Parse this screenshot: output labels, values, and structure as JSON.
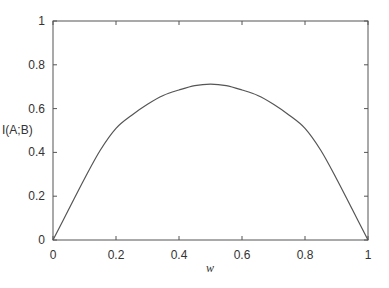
{
  "chart_data": {
    "type": "line",
    "title": "",
    "xlabel": "w",
    "ylabel": "I(A;B)",
    "xlim": [
      0,
      1
    ],
    "ylim": [
      0,
      1
    ],
    "xticks": [
      "0",
      "0.2",
      "0.4",
      "0.6",
      "0.8",
      "1"
    ],
    "yticks": [
      "0",
      "0.2",
      "0.4",
      "0.6",
      "0.8",
      "1"
    ],
    "grid": false,
    "legend": null,
    "series": [
      {
        "name": "I(A;B)",
        "color": "#555555",
        "x": [
          0,
          0.05,
          0.1,
          0.15,
          0.2,
          0.25,
          0.3,
          0.35,
          0.4,
          0.45,
          0.5,
          0.55,
          0.6,
          0.65,
          0.7,
          0.75,
          0.8,
          0.85,
          0.9,
          0.95,
          1
        ],
        "y": [
          0,
          0.14,
          0.28,
          0.41,
          0.51,
          0.57,
          0.62,
          0.66,
          0.685,
          0.705,
          0.712,
          0.705,
          0.685,
          0.66,
          0.62,
          0.57,
          0.51,
          0.41,
          0.28,
          0.14,
          0
        ]
      }
    ]
  }
}
